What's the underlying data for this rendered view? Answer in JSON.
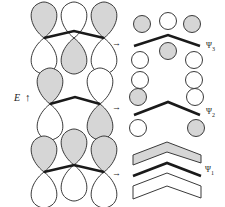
{
  "figure": {
    "type": "molecular-orbital-diagram",
    "system": "allyl pi system (3 p-orbitals)",
    "background_color": "#ffffff",
    "lobe_shaded_color": "#d6d6d6",
    "lobe_white_color": "#ffffff",
    "outline_color": "#3a3a3a",
    "bond_color": "#1a1a1a",
    "energy_axis": {
      "label": "E",
      "arrow_glyph": "↑",
      "direction": "up",
      "meaning": "increasing energy upward"
    },
    "transform_arrow_glyph": "→",
    "rows": [
      {
        "id": "psi3",
        "order_from_top": 1,
        "label": "Ψ",
        "subscript": "3",
        "nodes": 2,
        "left_panel": {
          "view": "side-on p orbitals",
          "orbital_count": 3,
          "phases_top": [
            "shaded",
            "white",
            "shaded"
          ],
          "phases_bottom": [
            "white",
            "shaded",
            "white"
          ],
          "connector": "peak"
        },
        "right_panel": {
          "view": "top-down lobes",
          "above_line": [
            "shaded",
            "white",
            "shaded"
          ],
          "below_line": [
            "white",
            "shaded",
            "white"
          ],
          "separator": "bent-line"
        }
      },
      {
        "id": "psi2",
        "order_from_top": 2,
        "label": "Ψ",
        "subscript": "2",
        "nodes": 1,
        "left_panel": {
          "view": "side-on p orbitals",
          "orbital_count": 2,
          "phases_top": [
            "shaded",
            "white"
          ],
          "phases_bottom": [
            "white",
            "shaded"
          ],
          "connector": "valley-then-peak"
        },
        "right_panel": {
          "view": "top-down lobes",
          "above_line": [
            "shaded",
            "none",
            "white"
          ],
          "below_line": [
            "white",
            "none",
            "shaded"
          ],
          "separator": "bent-line"
        }
      },
      {
        "id": "psi1",
        "order_from_top": 3,
        "label": "Ψ",
        "subscript": "1",
        "nodes": 0,
        "left_panel": {
          "view": "side-on p orbitals",
          "orbital_count": 3,
          "phases_top": [
            "shaded",
            "shaded",
            "shaded"
          ],
          "phases_bottom": [
            "white",
            "white",
            "white"
          ],
          "connector": "peak"
        },
        "right_panel": {
          "view": "top-down merged lobes",
          "above_line": [
            "shaded-chevron-band"
          ],
          "below_line": [
            "white-chevron-band"
          ],
          "separator": "bent-line"
        }
      }
    ]
  }
}
